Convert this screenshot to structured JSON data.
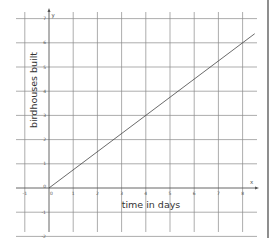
{
  "chart_data": {
    "type": "line",
    "title": "",
    "xlabel": "time in days",
    "ylabel": "birdhouses built",
    "x_var": "x",
    "y_var": "y",
    "xlim": [
      -1,
      8.5
    ],
    "ylim": [
      -2,
      7
    ],
    "grid": true,
    "x_ticks": [
      "-1",
      "0",
      "1",
      "2",
      "3",
      "4",
      "5",
      "6",
      "7",
      "8"
    ],
    "y_ticks": [
      "-2",
      "-1",
      "0",
      "1",
      "2",
      "3",
      "4",
      "5",
      "6",
      "7"
    ],
    "series": [
      {
        "name": "birdhouses built",
        "x": [
          0,
          8.5
        ],
        "y": [
          0,
          6.375
        ],
        "slope": 0.75,
        "points_on_grid": [
          [
            0,
            0
          ],
          [
            4,
            3
          ],
          [
            8,
            6
          ]
        ]
      }
    ]
  }
}
